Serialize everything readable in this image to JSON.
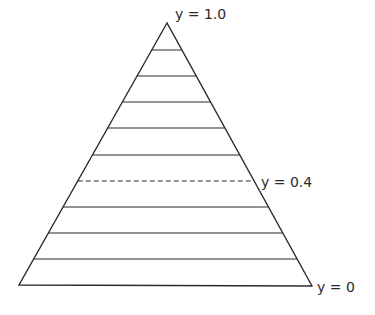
{
  "diagram": {
    "shape": "triangle",
    "apex": [
      167,
      23
    ],
    "base_left": [
      19,
      285
    ],
    "base_right": [
      312,
      286
    ],
    "stroke_color": "#2a2a2a",
    "levels": [
      {
        "y": 50,
        "style": "solid"
      },
      {
        "y": 76,
        "style": "solid"
      },
      {
        "y": 102,
        "style": "solid"
      },
      {
        "y": 128,
        "style": "solid"
      },
      {
        "y": 155,
        "style": "solid"
      },
      {
        "y": 181,
        "style": "dashed"
      },
      {
        "y": 207,
        "style": "solid"
      },
      {
        "y": 233,
        "style": "solid"
      },
      {
        "y": 259,
        "style": "solid"
      }
    ],
    "labels": {
      "top": "y = 1.0",
      "middle": "y = 0.4",
      "bottom": "y = 0"
    }
  }
}
